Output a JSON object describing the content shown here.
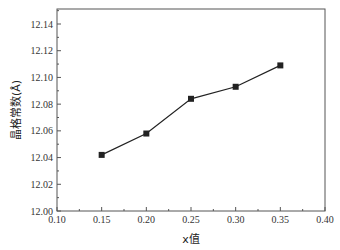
{
  "chart_data": {
    "type": "line",
    "title": "",
    "xlabel": "x值",
    "ylabel": "晶格常数(Å)",
    "x": [
      0.15,
      0.2,
      0.25,
      0.3,
      0.35
    ],
    "series": [
      {
        "name": "lattice constant",
        "values": [
          12.042,
          12.058,
          12.084,
          12.093,
          12.109
        ],
        "marker": "square",
        "color": "#222222"
      }
    ],
    "xlim": [
      0.1,
      0.4
    ],
    "ylim": [
      12.0,
      12.15
    ],
    "xticks": [
      "0.10",
      "0.15",
      "0.20",
      "0.25",
      "0.30",
      "0.35",
      "0.40"
    ],
    "yticks": [
      "12.00",
      "12.02",
      "12.04",
      "12.06",
      "12.08",
      "12.10",
      "12.12",
      "12.14"
    ],
    "grid": false,
    "legend": null
  }
}
